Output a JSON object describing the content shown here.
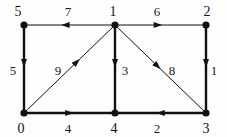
{
  "figure": {
    "background_color": "#fdfdfd",
    "ink_color": "#111111",
    "width": 227,
    "height": 137
  },
  "graph": {
    "kind": "directed-weighted-graph",
    "node_count": 6,
    "edge_count": 9,
    "nodes": [
      {
        "id": "5",
        "label": "5",
        "x": 24,
        "y": 25,
        "label_x": 18,
        "label_y": 11
      },
      {
        "id": "1",
        "label": "1",
        "x": 115,
        "y": 25,
        "label_x": 113,
        "label_y": 11
      },
      {
        "id": "2",
        "label": "2",
        "x": 206,
        "y": 25,
        "label_x": 207,
        "label_y": 11
      },
      {
        "id": "0",
        "label": "0",
        "x": 24,
        "y": 113,
        "label_x": 21,
        "label_y": 128
      },
      {
        "id": "4",
        "label": "4",
        "x": 115,
        "y": 113,
        "label_x": 114,
        "label_y": 128
      },
      {
        "id": "3",
        "label": "3",
        "x": 206,
        "y": 113,
        "label_x": 206,
        "label_y": 128
      }
    ],
    "edges": [
      {
        "id": "e-1-5",
        "from": "1",
        "to": "5",
        "weight": "7",
        "stroke": 1.0,
        "label_x": 68,
        "label_y": 11,
        "arrow_t": 0.6
      },
      {
        "id": "e-1-2",
        "from": "1",
        "to": "2",
        "weight": "6",
        "stroke": 1.0,
        "label_x": 157,
        "label_y": 11,
        "arrow_t": 0.52
      },
      {
        "id": "e-5-0",
        "from": "5",
        "to": "0",
        "weight": "5",
        "stroke": 2.4,
        "label_x": 13,
        "label_y": 70,
        "arrow_t": 0.48
      },
      {
        "id": "e-0-1",
        "from": "0",
        "to": "1",
        "weight": "9",
        "stroke": 1.0,
        "label_x": 58,
        "label_y": 70,
        "arrow_t": 0.62
      },
      {
        "id": "e-1-4",
        "from": "1",
        "to": "4",
        "weight": "3",
        "stroke": 2.4,
        "label_x": 125,
        "label_y": 70,
        "arrow_t": 0.48
      },
      {
        "id": "e-1-3",
        "from": "1",
        "to": "3",
        "weight": "8",
        "stroke": 1.0,
        "label_x": 172,
        "label_y": 70,
        "arrow_t": 0.5
      },
      {
        "id": "e-2-3",
        "from": "2",
        "to": "3",
        "weight": "1",
        "stroke": 2.4,
        "label_x": 214,
        "label_y": 70,
        "arrow_t": 0.48
      },
      {
        "id": "e-0-4",
        "from": "0",
        "to": "4",
        "weight": "4",
        "stroke": 2.4,
        "label_x": 68,
        "label_y": 128,
        "arrow_t": 0.55
      },
      {
        "id": "e-3-4",
        "from": "3",
        "to": "4",
        "weight": "2",
        "stroke": 2.4,
        "label_x": 157,
        "label_y": 128,
        "arrow_t": 0.55
      }
    ]
  }
}
